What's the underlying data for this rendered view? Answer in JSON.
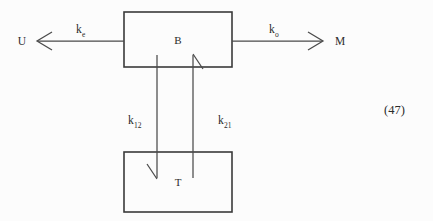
{
  "figure": {
    "equation_number": "(47)",
    "background_color": "#fcfcfc",
    "stroke_color": "#3a3a3a"
  },
  "nodes": [
    {
      "id": "B",
      "label": "B",
      "x": 124,
      "y": 12,
      "width": 108,
      "height": 55,
      "label_x": 178,
      "label_y": 44
    },
    {
      "id": "T",
      "label": "T",
      "x": 124,
      "y": 152,
      "width": 108,
      "height": 60,
      "label_x": 178,
      "label_y": 186
    }
  ],
  "terminals": [
    {
      "id": "U",
      "label": "U",
      "x": 22,
      "y": 45
    },
    {
      "id": "M",
      "label": "M",
      "x": 340,
      "y": 45
    }
  ],
  "arrows": [
    {
      "id": "k_e",
      "base": "k",
      "subscript": "e",
      "from": "B",
      "to": "U",
      "direction": "left",
      "label_x": 76,
      "label_y": 33,
      "sub_x": 83,
      "sub_y": 37
    },
    {
      "id": "k_o",
      "base": "k",
      "subscript": "o",
      "from": "B",
      "to": "M",
      "direction": "right",
      "label_x": 269,
      "label_y": 33,
      "sub_x": 276,
      "sub_y": 37
    },
    {
      "id": "k_12",
      "base": "k",
      "subscript": "12",
      "from": "B",
      "to": "T",
      "direction": "down",
      "label_x": 128,
      "label_y": 124,
      "sub_x": 135,
      "sub_y": 128
    },
    {
      "id": "k_21",
      "base": "k",
      "subscript": "21",
      "from": "T",
      "to": "B",
      "direction": "up",
      "label_x": 218,
      "label_y": 124,
      "sub_x": 225,
      "sub_y": 128
    }
  ]
}
